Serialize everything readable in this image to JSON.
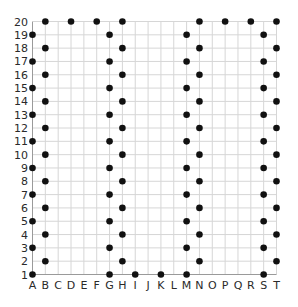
{
  "chart_data": {
    "type": "scatter",
    "title": "",
    "xlabel": "",
    "ylabel": "",
    "x_categories": [
      "A",
      "B",
      "C",
      "D",
      "E",
      "F",
      "G",
      "H",
      "I",
      "J",
      "K",
      "L",
      "M",
      "N",
      "O",
      "P",
      "Q",
      "R",
      "S",
      "T"
    ],
    "y_ticks": [
      1,
      2,
      3,
      4,
      5,
      6,
      7,
      8,
      9,
      10,
      11,
      12,
      13,
      14,
      15,
      16,
      17,
      18,
      19,
      20
    ],
    "ylim": [
      1,
      20
    ],
    "grid": true,
    "legend": null,
    "series": [
      {
        "name": "points",
        "color": "#111111",
        "points": [
          [
            "A",
            1
          ],
          [
            "A",
            3
          ],
          [
            "A",
            5
          ],
          [
            "A",
            7
          ],
          [
            "A",
            9
          ],
          [
            "A",
            11
          ],
          [
            "A",
            13
          ],
          [
            "A",
            15
          ],
          [
            "A",
            17
          ],
          [
            "A",
            19
          ],
          [
            "B",
            2
          ],
          [
            "B",
            4
          ],
          [
            "B",
            6
          ],
          [
            "B",
            8
          ],
          [
            "B",
            10
          ],
          [
            "B",
            12
          ],
          [
            "B",
            14
          ],
          [
            "B",
            16
          ],
          [
            "B",
            18
          ],
          [
            "B",
            20
          ],
          [
            "D",
            20
          ],
          [
            "F",
            20
          ],
          [
            "G",
            1
          ],
          [
            "G",
            3
          ],
          [
            "G",
            5
          ],
          [
            "G",
            7
          ],
          [
            "G",
            9
          ],
          [
            "G",
            11
          ],
          [
            "G",
            13
          ],
          [
            "G",
            15
          ],
          [
            "G",
            17
          ],
          [
            "G",
            19
          ],
          [
            "H",
            2
          ],
          [
            "H",
            4
          ],
          [
            "H",
            6
          ],
          [
            "H",
            8
          ],
          [
            "H",
            10
          ],
          [
            "H",
            12
          ],
          [
            "H",
            14
          ],
          [
            "H",
            16
          ],
          [
            "H",
            18
          ],
          [
            "H",
            20
          ],
          [
            "I",
            1
          ],
          [
            "K",
            1
          ],
          [
            "M",
            1
          ],
          [
            "M",
            3
          ],
          [
            "M",
            5
          ],
          [
            "M",
            7
          ],
          [
            "M",
            9
          ],
          [
            "M",
            11
          ],
          [
            "M",
            13
          ],
          [
            "M",
            15
          ],
          [
            "M",
            17
          ],
          [
            "M",
            19
          ],
          [
            "N",
            2
          ],
          [
            "N",
            4
          ],
          [
            "N",
            6
          ],
          [
            "N",
            8
          ],
          [
            "N",
            10
          ],
          [
            "N",
            12
          ],
          [
            "N",
            14
          ],
          [
            "N",
            16
          ],
          [
            "N",
            18
          ],
          [
            "N",
            20
          ],
          [
            "P",
            20
          ],
          [
            "R",
            20
          ],
          [
            "S",
            1
          ],
          [
            "S",
            3
          ],
          [
            "S",
            5
          ],
          [
            "S",
            7
          ],
          [
            "S",
            9
          ],
          [
            "S",
            11
          ],
          [
            "S",
            13
          ],
          [
            "S",
            15
          ],
          [
            "S",
            17
          ],
          [
            "S",
            19
          ],
          [
            "T",
            2
          ],
          [
            "T",
            4
          ],
          [
            "T",
            6
          ],
          [
            "T",
            8
          ],
          [
            "T",
            10
          ],
          [
            "T",
            12
          ],
          [
            "T",
            14
          ],
          [
            "T",
            16
          ],
          [
            "T",
            18
          ],
          [
            "T",
            20
          ]
        ]
      }
    ]
  },
  "colors": {
    "grid": "#d6d6d6",
    "axis": "#9a9a9a",
    "dot": "#111111",
    "label": "#2a2a2a"
  }
}
